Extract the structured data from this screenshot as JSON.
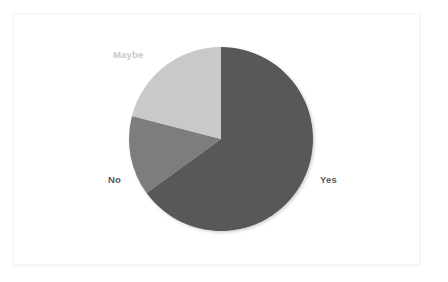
{
  "canvas": {
    "width": 448,
    "height": 282,
    "background_color": "#ffffff",
    "frame_border_color": "#f4f4f5"
  },
  "chart_data": {
    "type": "pie",
    "title": "",
    "subtitle": "",
    "xlabel": "",
    "ylabel": "",
    "grid": false,
    "legend_position": "none",
    "labels_position": "outside",
    "start_angle_deg": 0,
    "direction": "clockwise",
    "center": {
      "x": 221,
      "y": 139
    },
    "radius": 92,
    "categories": [
      "Yes",
      "No",
      "Maybe"
    ],
    "values": [
      65,
      13.5,
      21.5
    ],
    "slices": [
      {
        "label": "Yes",
        "value": 65,
        "percent": "65%",
        "color": "#58585a",
        "start_angle_deg": 0,
        "end_angle_deg": 234,
        "label_color": "#58585a"
      },
      {
        "label": "No",
        "value": 13.5,
        "percent": "13.5%",
        "color": "#7d7d7f",
        "start_angle_deg": 234,
        "end_angle_deg": 284.5,
        "label_color": "#58585a"
      },
      {
        "label": "Maybe",
        "value": 21.5,
        "percent": "21.5%",
        "color": "#c8c9ca",
        "start_angle_deg": 284.5,
        "end_angle_deg": 360,
        "label_color": "#c8c9ca"
      }
    ]
  },
  "labels": {
    "yes": "Yes",
    "no": "No",
    "maybe": "Maybe"
  },
  "colors": {
    "yes_slice": "#58585a",
    "no_slice": "#7d7d7f",
    "maybe_slice": "#c8c9ca",
    "dark_label_text": "#58585a",
    "light_label_text": "#c8c9ca"
  }
}
